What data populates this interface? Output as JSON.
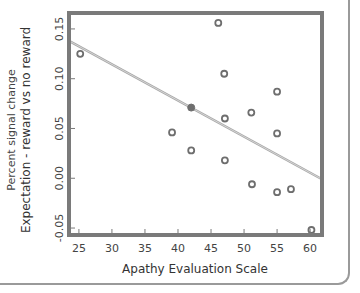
{
  "chart_data": {
    "type": "scatter",
    "title": "",
    "xlabel": "Apathy Evaluation Scale",
    "ylabel": "Expectation - reward vs no reward",
    "ylabel_secondary": "Percent signal change",
    "xlim": [
      23.5,
      61.8
    ],
    "ylim": [
      -0.057,
      0.166
    ],
    "x_ticks": [
      25,
      30,
      35,
      40,
      45,
      50,
      55,
      60
    ],
    "x_tick_labels": [
      "25",
      "30",
      "35",
      "40",
      "45",
      "50",
      "55",
      "60"
    ],
    "y_ticks": [
      -0.05,
      0.0,
      0.05,
      0.1,
      0.15
    ],
    "y_tick_labels": [
      "-0.05",
      "0.00",
      "0.05",
      "0.10",
      "0.15"
    ],
    "grid": false,
    "legend": null,
    "series": [
      {
        "name": "subjects",
        "marker": "open-circle",
        "x": [
          25.2,
          46.1,
          47.0,
          55.0,
          51.1,
          47.1,
          39.1,
          55.0,
          42.0,
          47.1,
          51.2,
          55.0,
          57.1,
          60.2
        ],
        "y": [
          0.125,
          0.156,
          0.105,
          0.087,
          0.066,
          0.06,
          0.046,
          0.045,
          0.028,
          0.018,
          -0.006,
          -0.014,
          -0.011,
          -0.052
        ]
      },
      {
        "name": "mean",
        "marker": "filled-circle",
        "x": [
          42.0
        ],
        "y": [
          0.071
        ]
      }
    ],
    "regression_line": {
      "x": [
        23.5,
        61.8
      ],
      "y": [
        0.138,
        -0.001
      ]
    },
    "colors": {
      "frame": "#7a7a7a",
      "marker": "#6e6e6e",
      "line": "#a8a8a8",
      "text": "#444444"
    }
  }
}
